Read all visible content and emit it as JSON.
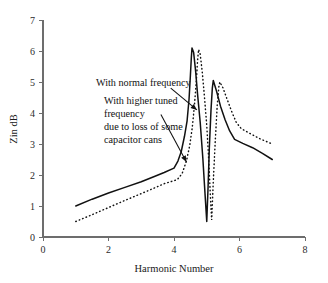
{
  "chart_data": {
    "type": "line",
    "title": "",
    "xlabel": "Harmonic Number",
    "ylabel": "Zin dB",
    "xlim": [
      0,
      8
    ],
    "ylim": [
      0,
      7
    ],
    "xticks": [
      0,
      2,
      4,
      6,
      8
    ],
    "yticks": [
      0,
      1,
      2,
      3,
      4,
      5,
      6,
      7
    ],
    "grid": false,
    "legend": "none (inline annotations with leader arrows)",
    "series": [
      {
        "name": "With normal frequency",
        "style": "solid",
        "color": "#111111",
        "points": [
          [
            1.0,
            1.0
          ],
          [
            1.5,
            1.22
          ],
          [
            2.0,
            1.42
          ],
          [
            2.5,
            1.6
          ],
          [
            3.0,
            1.78
          ],
          [
            3.4,
            1.95
          ],
          [
            3.7,
            2.08
          ],
          [
            4.0,
            2.22
          ],
          [
            4.12,
            2.45
          ],
          [
            4.22,
            2.75
          ],
          [
            4.32,
            3.25
          ],
          [
            4.4,
            3.75
          ],
          [
            4.46,
            4.45
          ],
          [
            4.5,
            5.2
          ],
          [
            4.53,
            5.8
          ],
          [
            4.55,
            6.1
          ],
          [
            4.6,
            5.95
          ],
          [
            4.66,
            5.35
          ],
          [
            4.72,
            4.6
          ],
          [
            4.8,
            3.7
          ],
          [
            4.88,
            2.55
          ],
          [
            4.95,
            1.35
          ],
          [
            5.0,
            0.5
          ],
          [
            5.04,
            1.6
          ],
          [
            5.08,
            2.9
          ],
          [
            5.13,
            4.1
          ],
          [
            5.17,
            4.8
          ],
          [
            5.2,
            5.05
          ],
          [
            5.3,
            4.7
          ],
          [
            5.42,
            4.22
          ],
          [
            5.56,
            3.78
          ],
          [
            5.7,
            3.42
          ],
          [
            5.85,
            3.15
          ],
          [
            6.1,
            3.02
          ],
          [
            6.4,
            2.88
          ],
          [
            6.7,
            2.7
          ],
          [
            7.0,
            2.5
          ]
        ]
      },
      {
        "name": "With higher tuned frequency due to loss of some capacitor cans",
        "style": "dotted",
        "color": "#111111",
        "points": [
          [
            1.0,
            0.5
          ],
          [
            1.5,
            0.72
          ],
          [
            2.0,
            0.95
          ],
          [
            2.5,
            1.18
          ],
          [
            3.0,
            1.4
          ],
          [
            3.4,
            1.58
          ],
          [
            3.7,
            1.72
          ],
          [
            4.1,
            1.85
          ],
          [
            4.25,
            2.05
          ],
          [
            4.38,
            2.45
          ],
          [
            4.48,
            2.95
          ],
          [
            4.56,
            3.55
          ],
          [
            4.62,
            4.2
          ],
          [
            4.68,
            5.0
          ],
          [
            4.72,
            5.7
          ],
          [
            4.75,
            6.05
          ],
          [
            4.8,
            5.9
          ],
          [
            4.86,
            5.35
          ],
          [
            4.92,
            4.65
          ],
          [
            5.0,
            3.6
          ],
          [
            5.06,
            2.5
          ],
          [
            5.11,
            1.35
          ],
          [
            5.15,
            0.55
          ],
          [
            5.2,
            1.8
          ],
          [
            5.26,
            3.1
          ],
          [
            5.32,
            4.25
          ],
          [
            5.37,
            4.85
          ],
          [
            5.4,
            5.0
          ],
          [
            5.5,
            4.8
          ],
          [
            5.62,
            4.45
          ],
          [
            5.76,
            4.05
          ],
          [
            5.9,
            3.7
          ],
          [
            6.05,
            3.5
          ],
          [
            6.3,
            3.35
          ],
          [
            6.6,
            3.18
          ],
          [
            7.0,
            3.0
          ]
        ]
      }
    ],
    "annotations": [
      {
        "id": "normal-frequency",
        "text": "With normal frequency",
        "text_x": 1.55,
        "text_y": 5.05,
        "arrow_from": [
          3.9,
          4.8
        ],
        "arrow_to": [
          4.7,
          4.1
        ]
      },
      {
        "id": "higher-tuned-frequency",
        "text_lines": [
          "With higher tuned",
          "frequency",
          "due to loss of some",
          "capacitor cans"
        ],
        "text_x": 1.85,
        "text_y": 4.45,
        "arrow_from": [
          3.6,
          3.95
        ],
        "arrow_to": [
          4.38,
          2.42
        ]
      }
    ]
  },
  "axes": {
    "x_title": "Harmonic Number",
    "y_title": "Zin dB",
    "x_tick_labels": [
      "0",
      "2",
      "4",
      "6",
      "8"
    ],
    "y_tick_labels": [
      "0",
      "1",
      "2",
      "3",
      "4",
      "5",
      "6",
      "7"
    ]
  },
  "annotations_text": {
    "normal": "With normal frequency",
    "higher_line1": "With higher tuned",
    "higher_line2": "frequency",
    "higher_line3": "due to loss of some",
    "higher_line4": "capacitor cans"
  },
  "colors": {
    "background": "#ffffff",
    "axis": "#6d6d6d",
    "curve": "#111111",
    "text": "#111111"
  }
}
